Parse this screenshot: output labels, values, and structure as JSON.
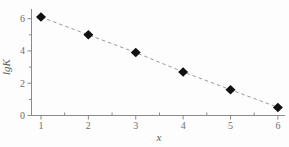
{
  "chart": {
    "background": "#fdfdfd"
  },
  "chart_data": {
    "type": "line",
    "x": [
      1,
      2,
      3,
      4,
      5,
      6
    ],
    "values": [
      6.1,
      5.0,
      3.9,
      2.7,
      1.6,
      0.5
    ],
    "title": "",
    "xlabel": "x",
    "ylabel": "lgK",
    "xlim": [
      0.8,
      6.15
    ],
    "ylim": [
      0,
      6.6
    ],
    "x_ticks": [
      1,
      2,
      3,
      4,
      5,
      6
    ],
    "y_ticks": [
      0,
      2,
      4,
      6
    ],
    "x_minor_ticks": [
      1.5,
      2.5,
      3.5,
      4.5,
      5.5
    ],
    "y_minor_ticks": [
      1,
      3,
      5
    ],
    "grid": false,
    "legend": "none",
    "line_style": "dashed",
    "marker": "filled-diamond",
    "colors": {
      "marker": "#111111",
      "line": "#9a9a9a",
      "axis": "#8a8a8a",
      "tick_label": "#6e6e6e",
      "axis_label": "#5a5a5a"
    }
  }
}
